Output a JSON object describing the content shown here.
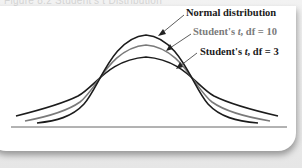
{
  "figure": {
    "caption": "Figure 8.2 Student's t Distribution",
    "labels": {
      "normal": "Normal distribution",
      "t10_prefix": "Student's ",
      "t10_var": "t",
      "t10_suffix": ", df = 10",
      "t3_prefix": "Student's ",
      "t3_var": "t",
      "t3_suffix": ", df = 3"
    },
    "colors": {
      "normal": "#1a1a1a",
      "t10": "#7a7a7a",
      "t3": "#1a1a1a",
      "baseline": "#555555",
      "card": "#ffffff",
      "background": "#e8e8e8"
    },
    "curves": [
      {
        "name": "Normal distribution",
        "peak_height": 0.399,
        "tail": "thinnest"
      },
      {
        "name": "Student's t, df = 10",
        "peak_height": 0.389,
        "tail": "medium"
      },
      {
        "name": "Student's t, df = 3",
        "peak_height": 0.368,
        "tail": "heaviest"
      }
    ]
  }
}
